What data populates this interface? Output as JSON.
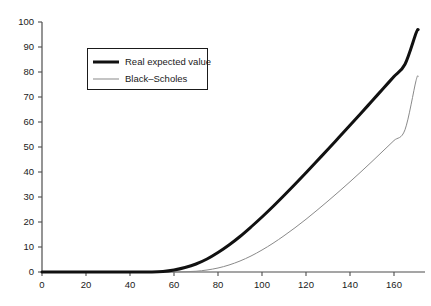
{
  "chart_data": {
    "type": "line",
    "title": "",
    "xlabel": "",
    "ylabel": "",
    "xlim": [
      0,
      180
    ],
    "ylim": [
      0,
      100
    ],
    "grid": false,
    "legend_position": "upper-left-inside",
    "xticks": [
      0,
      20,
      40,
      60,
      80,
      100,
      120,
      140,
      160
    ],
    "yticks": [
      0,
      10,
      20,
      30,
      40,
      50,
      60,
      70,
      80,
      90,
      100
    ],
    "x": [
      0,
      10,
      20,
      30,
      40,
      50,
      55,
      60,
      65,
      70,
      75,
      80,
      85,
      90,
      95,
      100,
      105,
      110,
      115,
      120,
      125,
      130,
      135,
      140,
      145,
      150,
      155,
      160,
      165,
      170,
      171
    ],
    "series": [
      {
        "name": "Real expected value",
        "color": "#111111",
        "linewidth": 3,
        "values": [
          0,
          0,
          0,
          0,
          0,
          0,
          0.2,
          0.8,
          1.8,
          3.2,
          5.2,
          7.8,
          10.8,
          14.2,
          18.0,
          22.0,
          26.2,
          30.6,
          35.1,
          39.7,
          44.4,
          49.1,
          53.9,
          58.7,
          63.5,
          68.4,
          73.3,
          78.2,
          83.1,
          95.5,
          97.0
        ]
      },
      {
        "name": "Black–Scholes",
        "color": "#8a8a8a",
        "linewidth": 1,
        "values": [
          0,
          0,
          0,
          0,
          0,
          0,
          0,
          0,
          0.1,
          0.3,
          0.8,
          1.6,
          2.8,
          4.4,
          6.4,
          8.8,
          11.5,
          14.5,
          17.7,
          21.1,
          24.7,
          28.4,
          32.2,
          36.1,
          40.1,
          44.2,
          48.4,
          52.6,
          56.9,
          76.5,
          78.0
        ]
      }
    ]
  },
  "legend": {
    "entries": [
      {
        "label": "Real expected value",
        "swatch": "thick-line-swatch"
      },
      {
        "label": "Black–Scholes",
        "swatch": "thin-line-swatch"
      }
    ]
  },
  "axes": {
    "x_tick_labels": [
      "0",
      "20",
      "40",
      "60",
      "80",
      "100",
      "120",
      "140",
      "160"
    ],
    "y_tick_labels": [
      "0",
      "10",
      "20",
      "30",
      "40",
      "50",
      "60",
      "70",
      "80",
      "90",
      "100"
    ],
    "axis_color": "#4d4d4d"
  }
}
